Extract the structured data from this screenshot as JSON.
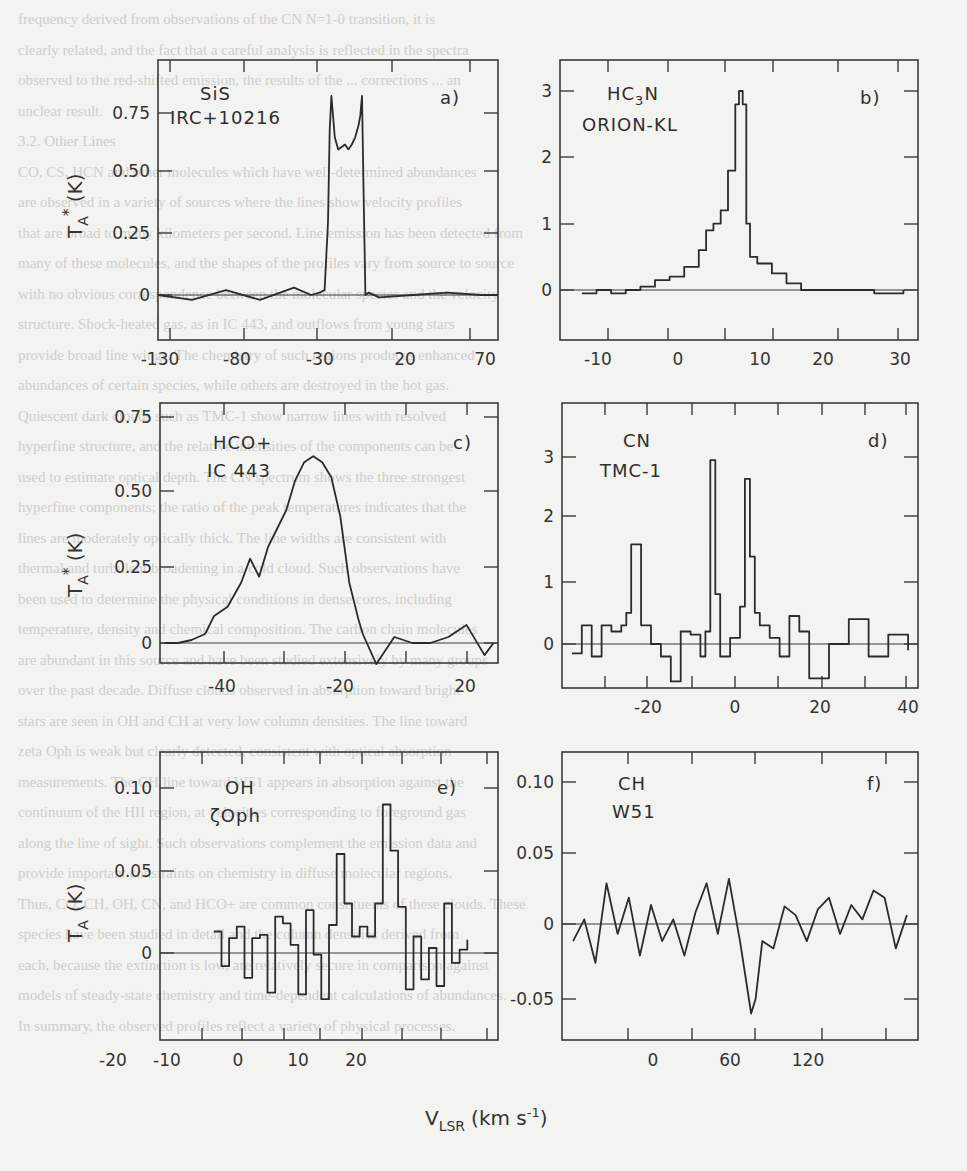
{
  "figure": {
    "x_axis_title": "V",
    "x_axis_sub": "LSR",
    "x_axis_units": "(km s",
    "x_axis_units_sup": "-1",
    "x_axis_units_close": ")",
    "y_axis_title_top": "T",
    "y_axis_title_sub": "A",
    "y_axis_title_sup": "*",
    "y_axis_units": "(K)",
    "y_axis_title_bottom": "T",
    "y_axis_title_bottom_sub": "A",
    "y_axis_units_bottom": "(K)"
  },
  "background_text": [
    "frequency derived from observations of the CN N=1-0 transition, it is",
    "clearly related, and the fact that a careful analysis is reflected in the spectra",
    "observed to the red-shifted emission, the results of the ... corrections ... an",
    "unclear result.",
    "3.2. Other Lines",
    "CO, CS, HCN and other molecules which have well-determined abundances",
    "are observed in a variety of sources where the lines show velocity profiles",
    "that are broad to many kilometers per second. Line emission has been detected from",
    "many of these molecules, and the shapes of the profiles vary from source to source",
    "with no obvious correspondence between the molecular species and the velocity",
    "structure. Shock-heated gas, as in IC 443, and outflows from young stars",
    "provide broad line wings. The chemistry of such regions produces enhanced",
    "abundances of certain species, while others are destroyed in the hot gas.",
    "Quiescent dark clouds such as TMC-1 show narrow lines with resolved",
    "hyperfine structure, and the relative intensities of the components can be",
    "used to estimate optical depth. The CN spectrum shows the three strongest",
    "hyperfine components; the ratio of the peak temperatures indicates that the",
    "lines are moderately optically thick. The line widths are consistent with",
    "thermal and turbulent broadening in a cold cloud. Such observations have",
    "been used to determine the physical conditions in dense cores, including",
    "temperature, density and chemical composition. The carbon chain molecules",
    "are abundant in this source and have been studied extensively by many groups",
    "over the past decade. Diffuse clouds observed in absorption toward bright",
    "stars are seen in OH and CH at very low column densities. The line toward",
    "zeta Oph is weak but clearly detected, consistent with optical absorption",
    "measurements. The CH line toward W51 appears in absorption against the",
    "continuum of the HII region, at velocities corresponding to foreground gas",
    "along the line of sight. Such observations complement the emission data and",
    "provide important constraints on chemistry in diffuse molecular regions.",
    "Thus, CO, CH, OH, CN, and HCO+ are common constituents of these clouds. These",
    "species have been studied in detail and the column densities derived from",
    "each, because the extinction is low, are relatively secure in comparison against",
    "models of steady-state chemistry and time-dependent calculations of abundances.",
    "In summary, the observed profiles reflect a variety of physical processes."
  ],
  "panels": [
    {
      "id": "a",
      "label": "a)",
      "molecule": "SiS",
      "source": "IRC+10216",
      "xticks": [
        "-130",
        "-80",
        "-30",
        "20",
        "70"
      ],
      "yticks": [
        "0.75",
        "0.50",
        "0.25",
        "0"
      ]
    },
    {
      "id": "b",
      "label": "b)",
      "molecule": "HC",
      "molecule_sub": "3",
      "molecule_tail": "N",
      "source": "ORION-KL",
      "xticks": [
        "-10",
        "0",
        "10",
        "20",
        "30"
      ],
      "yticks": [
        "3",
        "2",
        "1",
        "0"
      ]
    },
    {
      "id": "c",
      "label": "c)",
      "molecule": "HCO+",
      "source": "IC 443",
      "xticks": [
        "-40",
        "-20",
        "20"
      ],
      "yticks": [
        "0.75",
        "0.50",
        "0.25",
        "0"
      ]
    },
    {
      "id": "d",
      "label": "d)",
      "molecule": "CN",
      "source": "TMC-1",
      "xticks": [
        "-20",
        "0",
        "20",
        "40"
      ],
      "yticks": [
        "3",
        "2",
        "1",
        "0"
      ]
    },
    {
      "id": "e",
      "label": "e)",
      "molecule": "OH",
      "source": "ζOph",
      "xticks": [
        "-20",
        "-10",
        "0",
        "10",
        "20"
      ],
      "yticks": [
        "0.10",
        "0.05",
        "0"
      ]
    },
    {
      "id": "f",
      "label": "f)",
      "molecule": "CH",
      "source": "W51",
      "xticks": [
        "0",
        "60",
        "120"
      ],
      "yticks": [
        "0.10",
        "0.05",
        "0",
        "-0.05"
      ]
    }
  ],
  "chart_data": [
    {
      "type": "line",
      "panel": "a",
      "title": "SiS IRC+10216",
      "xlabel": "V_LSR (km s^-1)",
      "ylabel": "T_A* (K)",
      "xlim": [
        -130,
        70
      ],
      "ylim": [
        -0.15,
        0.95
      ],
      "grid": false,
      "series": [
        {
          "name": "SiS",
          "x": [
            -130,
            -110,
            -90,
            -70,
            -50,
            -40,
            -35,
            -32,
            -30,
            -29,
            -28,
            -26,
            -24,
            -22,
            -20,
            -18,
            -16,
            -14,
            -12,
            -11,
            -10,
            -9,
            -8,
            -6,
            0,
            20,
            40,
            60,
            70
          ],
          "y": [
            0.0,
            -0.02,
            0.02,
            -0.02,
            0.03,
            0.0,
            0.01,
            0.02,
            0.3,
            0.68,
            0.82,
            0.65,
            0.6,
            0.61,
            0.62,
            0.6,
            0.62,
            0.65,
            0.7,
            0.74,
            0.82,
            0.4,
            0.0,
            0.01,
            -0.01,
            0.0,
            0.01,
            0.0,
            0.0
          ]
        }
      ]
    },
    {
      "type": "line",
      "panel": "b",
      "title": "HC3N ORION-KL",
      "xlabel": "V_LSR (km s^-1)",
      "ylabel": "T_A* (K)",
      "xlim": [
        -15,
        34
      ],
      "ylim": [
        -0.7,
        3.5
      ],
      "grid": false,
      "series": [
        {
          "name": "HC3N",
          "x": [
            -12,
            -10,
            -8,
            -6,
            -4,
            -2,
            0,
            2,
            4,
            5,
            6,
            7,
            8,
            9,
            9.5,
            10,
            10.5,
            11,
            12,
            14,
            16,
            18,
            20,
            24,
            28,
            32
          ],
          "y": [
            -0.05,
            0.0,
            -0.05,
            0.0,
            0.05,
            0.15,
            0.2,
            0.35,
            0.6,
            0.9,
            1.0,
            1.2,
            1.8,
            2.8,
            3.0,
            2.8,
            1.0,
            0.5,
            0.4,
            0.25,
            0.1,
            0.0,
            0.0,
            0.0,
            -0.05,
            0.0
          ]
        }
      ]
    },
    {
      "type": "line",
      "panel": "c",
      "title": "HCO+ IC 443",
      "xlabel": "V_LSR (km s^-1)",
      "ylabel": "T_A* (K)",
      "xlim": [
        -48,
        27
      ],
      "ylim": [
        -0.15,
        0.8
      ],
      "grid": false,
      "series": [
        {
          "name": "HCO+",
          "x": [
            -47,
            -44,
            -41,
            -38,
            -36,
            -33,
            -30,
            -28,
            -26,
            -24,
            -22,
            -20,
            -18,
            -16,
            -14,
            -12,
            -10,
            -8,
            -6,
            -4,
            -3,
            0,
            4,
            8,
            12,
            16,
            20,
            24,
            26
          ],
          "y": [
            0.0,
            0.0,
            0.01,
            0.03,
            0.09,
            0.12,
            0.2,
            0.28,
            0.22,
            0.32,
            0.38,
            0.44,
            0.54,
            0.6,
            0.62,
            0.6,
            0.55,
            0.42,
            0.2,
            0.08,
            0.03,
            -0.07,
            0.02,
            0.0,
            0.0,
            0.02,
            0.06,
            -0.04,
            0.0
          ]
        }
      ]
    },
    {
      "type": "line",
      "panel": "d",
      "title": "CN TMC-1",
      "xlabel": "V_LSR (km s^-1)",
      "ylabel": "T_A* (K)",
      "xlim": [
        -30,
        42
      ],
      "ylim": [
        -0.7,
        3.8
      ],
      "grid": false,
      "series": [
        {
          "name": "CN",
          "x": [
            -28,
            -26,
            -24,
            -22,
            -20,
            -18,
            -17,
            -16,
            -14,
            -12,
            -10,
            -8,
            -6,
            -4,
            -2,
            -1,
            0,
            1,
            2,
            4,
            6,
            7,
            8,
            9,
            10,
            12,
            14,
            16,
            18,
            20,
            24,
            28,
            32,
            36,
            40
          ],
          "y": [
            -0.15,
            0.3,
            -0.2,
            0.3,
            0.2,
            0.3,
            0.5,
            1.6,
            0.3,
            0.0,
            -0.2,
            -0.6,
            0.2,
            0.15,
            -0.2,
            0.2,
            2.95,
            0.8,
            -0.2,
            0.1,
            0.6,
            2.65,
            1.4,
            0.5,
            0.3,
            0.1,
            -0.2,
            0.45,
            0.2,
            -0.55,
            0.0,
            0.4,
            -0.2,
            0.15,
            -0.1
          ]
        }
      ]
    },
    {
      "type": "line",
      "panel": "e",
      "title": "OH ζOph",
      "xlabel": "V_LSR (km s^-1)",
      "ylabel": "T_A (K)",
      "xlim": [
        -22,
        22
      ],
      "ylim": [
        -0.03,
        0.12
      ],
      "grid": false,
      "series": [
        {
          "name": "OH",
          "x": [
            -15,
            -14,
            -13,
            -12,
            -11,
            -10,
            -9,
            -8,
            -7,
            -6,
            -5,
            -4,
            -3,
            -2,
            -1,
            0,
            1,
            2,
            3,
            4,
            5,
            6,
            7,
            8,
            9,
            10,
            11,
            12,
            13,
            14,
            15,
            16,
            17,
            18
          ],
          "y": [
            0.013,
            -0.008,
            0.009,
            0.016,
            -0.015,
            0.009,
            0.011,
            -0.024,
            0.022,
            0.018,
            0.005,
            -0.025,
            0.026,
            -0.001,
            -0.028,
            0.017,
            0.06,
            0.03,
            0.01,
            0.016,
            0.01,
            0.03,
            0.09,
            0.062,
            0.028,
            -0.022,
            0.01,
            -0.016,
            0.003,
            -0.02,
            0.03,
            -0.006,
            0.002,
            0.008
          ]
        }
      ]
    },
    {
      "type": "line",
      "panel": "f",
      "title": "CH W51",
      "xlabel": "V_LSR (km s^-1)",
      "ylabel": "T_A (K)",
      "xlim": [
        -25,
        135
      ],
      "ylim": [
        -0.065,
        0.12
      ],
      "grid": false,
      "series": [
        {
          "name": "CH",
          "x": [
            -20,
            -15,
            -10,
            -5,
            0,
            5,
            10,
            15,
            20,
            25,
            30,
            35,
            40,
            45,
            50,
            55,
            58,
            60,
            62,
            65,
            70,
            75,
            80,
            85,
            90,
            95,
            100,
            105,
            110,
            115,
            120,
            125,
            130
          ],
          "y": [
            -0.01,
            0.005,
            -0.025,
            0.03,
            -0.005,
            0.02,
            -0.02,
            0.015,
            -0.01,
            0.005,
            -0.02,
            0.01,
            0.03,
            -0.005,
            0.033,
            -0.01,
            -0.04,
            -0.06,
            -0.05,
            -0.01,
            -0.015,
            0.014,
            0.008,
            -0.01,
            0.012,
            0.02,
            -0.005,
            0.015,
            0.005,
            0.025,
            0.02,
            -0.015,
            0.008
          ]
        }
      ]
    }
  ]
}
